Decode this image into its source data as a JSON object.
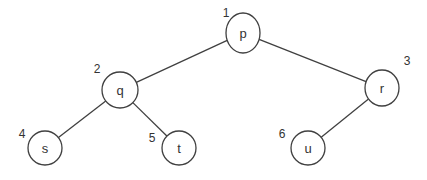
{
  "diagram": {
    "type": "binary-tree",
    "nodes": [
      {
        "id": "p",
        "label": "p",
        "index": "1",
        "cx": 243,
        "cy": 33,
        "rx": 17,
        "ry": 20,
        "ix": 226,
        "iy": 13
      },
      {
        "id": "q",
        "label": "q",
        "index": "2",
        "cx": 120,
        "cy": 90,
        "rx": 18,
        "ry": 18,
        "ix": 97,
        "iy": 69
      },
      {
        "id": "r",
        "label": "r",
        "index": "3",
        "cx": 382,
        "cy": 88,
        "rx": 17,
        "ry": 18,
        "ix": 407,
        "iy": 61
      },
      {
        "id": "s",
        "label": "s",
        "index": "4",
        "cx": 45,
        "cy": 148,
        "rx": 17,
        "ry": 17,
        "ix": 22,
        "iy": 134
      },
      {
        "id": "t",
        "label": "t",
        "index": "5",
        "cx": 179,
        "cy": 148,
        "rx": 17,
        "ry": 17,
        "ix": 152,
        "iy": 138
      },
      {
        "id": "u",
        "label": "u",
        "index": "6",
        "cx": 308,
        "cy": 148,
        "rx": 17,
        "ry": 17,
        "ix": 282,
        "iy": 134
      }
    ],
    "edges": [
      {
        "from": "p",
        "to": "q"
      },
      {
        "from": "p",
        "to": "r"
      },
      {
        "from": "q",
        "to": "s"
      },
      {
        "from": "q",
        "to": "t"
      },
      {
        "from": "r",
        "to": "u"
      }
    ]
  }
}
